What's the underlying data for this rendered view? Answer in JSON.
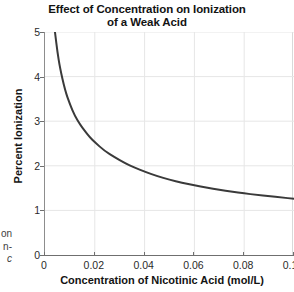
{
  "chart_data": {
    "type": "line",
    "title": "Effect of Concentration on Ionization of a Weak Acid",
    "title_lines": [
      "Effect of Concentration on Ionization",
      "of a Weak Acid"
    ],
    "xlabel": "Concentration of Nicotinic Acid (mol/L)",
    "ylabel": "Percent Ionization",
    "xlim": [
      0,
      0.1
    ],
    "ylim": [
      0,
      5
    ],
    "grid": true,
    "legend": "none",
    "xticks": [
      0,
      0.02,
      0.04,
      0.06,
      0.08,
      0.1
    ],
    "xticklabels": [
      "0",
      "0.02",
      "0.04",
      "0.06",
      "0.08",
      "0.10"
    ],
    "yticks": [
      0,
      1,
      2,
      3,
      4,
      5
    ],
    "yticklabels": [
      "0",
      "1",
      "2",
      "3",
      "4",
      "5"
    ],
    "series": [
      {
        "name": "Percent ionization of nicotinic acid",
        "color": "#3a3a3a",
        "x": [
          0.004,
          0.005,
          0.006,
          0.008,
          0.01,
          0.012,
          0.014,
          0.016,
          0.018,
          0.02,
          0.024,
          0.028,
          0.032,
          0.036,
          0.04,
          0.045,
          0.05,
          0.055,
          0.06,
          0.065,
          0.07,
          0.075,
          0.08,
          0.085,
          0.09,
          0.095,
          0.1
        ],
        "y": [
          5.0,
          4.55,
          4.2,
          3.7,
          3.38,
          3.12,
          2.93,
          2.78,
          2.64,
          2.53,
          2.33,
          2.19,
          2.06,
          1.96,
          1.87,
          1.77,
          1.69,
          1.62,
          1.56,
          1.51,
          1.46,
          1.42,
          1.38,
          1.35,
          1.32,
          1.29,
          1.26
        ]
      }
    ]
  },
  "caption_fragment": {
    "lines": [
      "on",
      "n-",
      "c"
    ]
  }
}
